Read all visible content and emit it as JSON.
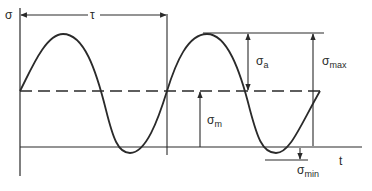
{
  "diagram": {
    "colors": {
      "ink": "#2a2a2a",
      "background": "#ffffff"
    },
    "labels": {
      "y_axis": "σ",
      "x_axis": "t",
      "period": "τ",
      "amplitude": {
        "base": "σ",
        "sub": "a"
      },
      "max": {
        "base": "σ",
        "sub": "max"
      },
      "mean": {
        "base": "σ",
        "sub": "m"
      },
      "min": {
        "base": "σ",
        "sub": "min"
      }
    }
  }
}
